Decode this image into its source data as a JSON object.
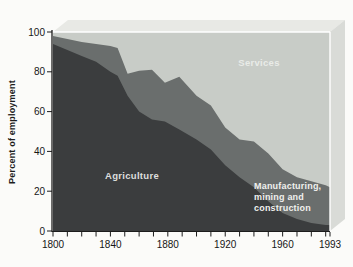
{
  "chart": {
    "ylabel": "Percent of employment",
    "area_labels": {
      "services": "Services",
      "agriculture": "Agriculture",
      "manufacturing": "Manufacturing,\nmining and\nconstruction"
    }
  },
  "colors": {
    "background": "#fbfbf9",
    "top_face": "#e8e9e5",
    "side_face": "#d9dbd7",
    "edge_highlight": "#ffffff",
    "axis": "#1c1c1c",
    "tick_text": "#161616"
  },
  "chart_data": {
    "type": "area",
    "stacked": true,
    "percent_of_total": true,
    "title": "",
    "xlabel": "",
    "ylabel": "Percent of employment",
    "xlim": [
      1800,
      1993
    ],
    "ylim": [
      0,
      100
    ],
    "x": [
      1800,
      1810,
      1820,
      1830,
      1840,
      1845,
      1852,
      1860,
      1869,
      1878,
      1888,
      1900,
      1910,
      1920,
      1930,
      1940,
      1950,
      1960,
      1970,
      1980,
      1990,
      1993
    ],
    "series": [
      {
        "name": "Agriculture",
        "color": "#3b3d3e",
        "values": [
          94,
          91,
          88,
          85,
          80,
          78,
          68,
          60,
          56,
          55,
          51,
          46,
          41,
          33,
          27,
          22,
          15,
          9,
          6,
          4,
          3,
          3
        ]
      },
      {
        "name": "Manufacturing, mining and construction",
        "color": "#6a6e6d",
        "values": [
          4,
          5.5,
          7,
          9,
          13,
          14,
          11,
          20.5,
          25,
          19.5,
          26.5,
          22,
          22,
          19,
          19,
          23,
          24,
          22,
          21,
          21,
          20,
          19
        ]
      },
      {
        "name": "Services",
        "color": "#c8ccc7",
        "values": [
          2,
          3.5,
          5,
          6,
          7,
          8,
          21,
          19.5,
          19,
          25.5,
          22.5,
          32,
          37,
          48,
          54,
          55,
          61,
          69,
          73,
          75,
          77,
          78
        ]
      }
    ],
    "x_major_ticks": [
      1800,
      1840,
      1880,
      1920,
      1960,
      1993
    ],
    "x_minor_tick_interval": 10,
    "y_ticks": [
      0,
      20,
      40,
      60,
      80,
      100
    ],
    "grid": false,
    "legend_position": "labels-inside-areas",
    "style_3d": true
  }
}
